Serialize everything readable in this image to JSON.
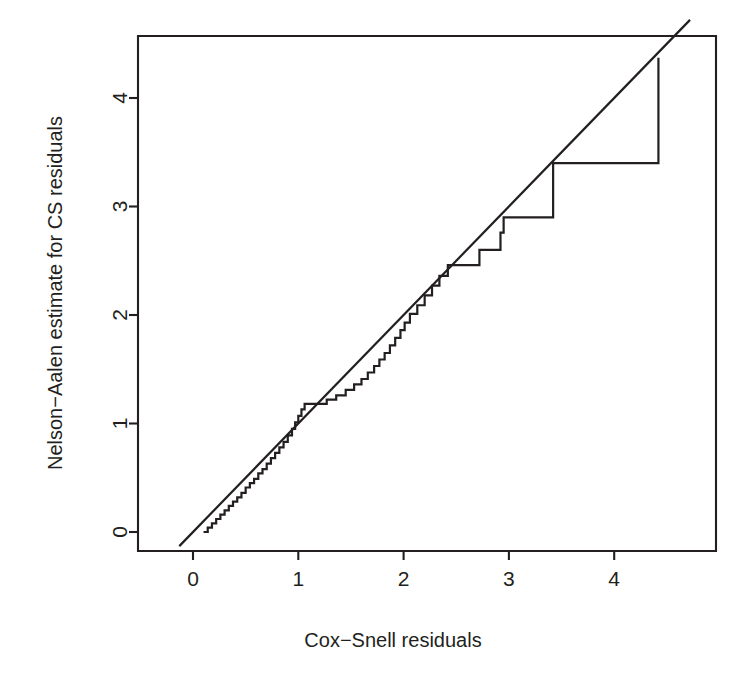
{
  "figure": {
    "background_color": "#ffffff",
    "ink_color": "#231f20",
    "width": 749,
    "height": 684
  },
  "chart_data": {
    "type": "line",
    "title": "",
    "subtitle": "",
    "xlabel": "Cox−Snell residuals",
    "ylabel": "Nelson−Aalen estimate for CS residuals",
    "xlim": [
      -0.55,
      4.97
    ],
    "ylim": [
      -0.18,
      4.75
    ],
    "xticks": [
      0,
      1,
      2,
      3,
      4
    ],
    "xtick_labels": [
      "0",
      "1",
      "2",
      "3",
      "4"
    ],
    "yticks": [
      0,
      1,
      2,
      3,
      4
    ],
    "ytick_labels": [
      "0",
      "1",
      "2",
      "3",
      "4"
    ],
    "grid": false,
    "legend": "none",
    "annotations": [],
    "series": [
      {
        "name": "reference-line",
        "kind": "line",
        "note": "45-degree identity reference line y = x",
        "x": [
          -0.13,
          4.72
        ],
        "y": [
          -0.13,
          4.72
        ]
      },
      {
        "name": "nelson-aalen-step",
        "kind": "step",
        "note": "Nelson-Aalen cumulative hazard estimate of the Cox-Snell residuals, plotted as a right-continuous step function",
        "points": [
          [
            0.1,
            0.0
          ],
          [
            0.14,
            0.04
          ],
          [
            0.18,
            0.08
          ],
          [
            0.22,
            0.12
          ],
          [
            0.26,
            0.16
          ],
          [
            0.3,
            0.2
          ],
          [
            0.34,
            0.24
          ],
          [
            0.38,
            0.28
          ],
          [
            0.42,
            0.32
          ],
          [
            0.46,
            0.36
          ],
          [
            0.5,
            0.41
          ],
          [
            0.54,
            0.45
          ],
          [
            0.58,
            0.49
          ],
          [
            0.62,
            0.54
          ],
          [
            0.66,
            0.58
          ],
          [
            0.7,
            0.63
          ],
          [
            0.74,
            0.68
          ],
          [
            0.78,
            0.73
          ],
          [
            0.82,
            0.78
          ],
          [
            0.86,
            0.83
          ],
          [
            0.9,
            0.89
          ],
          [
            0.94,
            0.95
          ],
          [
            0.97,
            1.01
          ],
          [
            1.0,
            1.07
          ],
          [
            1.03,
            1.13
          ],
          [
            1.06,
            1.18
          ],
          [
            1.2,
            1.18
          ],
          [
            1.27,
            1.22
          ],
          [
            1.36,
            1.26
          ],
          [
            1.45,
            1.31
          ],
          [
            1.53,
            1.36
          ],
          [
            1.6,
            1.41
          ],
          [
            1.66,
            1.47
          ],
          [
            1.72,
            1.53
          ],
          [
            1.77,
            1.59
          ],
          [
            1.82,
            1.65
          ],
          [
            1.87,
            1.72
          ],
          [
            1.92,
            1.79
          ],
          [
            1.97,
            1.86
          ],
          [
            2.01,
            1.93
          ],
          [
            2.06,
            2.01
          ],
          [
            2.13,
            2.09
          ],
          [
            2.2,
            2.18
          ],
          [
            2.27,
            2.27
          ],
          [
            2.34,
            2.36
          ],
          [
            2.42,
            2.46
          ],
          [
            2.62,
            2.46
          ],
          [
            2.72,
            2.6
          ],
          [
            2.86,
            2.6
          ],
          [
            2.92,
            2.76
          ],
          [
            2.95,
            2.9
          ],
          [
            3.42,
            2.9
          ],
          [
            3.42,
            3.4
          ],
          [
            4.42,
            3.4
          ],
          [
            4.42,
            4.37
          ]
        ]
      }
    ]
  }
}
